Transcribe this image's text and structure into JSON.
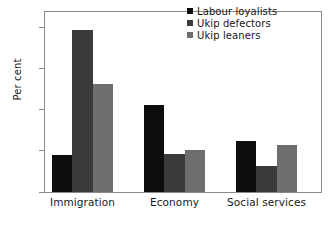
{
  "chart_data": {
    "type": "bar",
    "title": "",
    "subtitle": "",
    "xlabel": "",
    "ylabel": "Per cent",
    "categories": [
      "Immigration",
      "Economy",
      "Social services"
    ],
    "series": [
      {
        "name": "Labour loyalists",
        "color": "#0d0d0d",
        "values": [
          9.0,
          21.2,
          12.3
        ]
      },
      {
        "name": "Ukip defectors",
        "color": "#3a3a3a",
        "values": [
          39.3,
          9.2,
          6.3
        ]
      },
      {
        "name": "Ukip leaners",
        "color": "#6e6e6e",
        "values": [
          26.2,
          10.3,
          11.4
        ]
      }
    ],
    "ylim": [
      0,
      44
    ],
    "yticks": [
      0,
      10,
      20,
      30,
      40
    ],
    "ytick_labels": [
      "0",
      "10",
      "20",
      "30",
      "40"
    ],
    "grid": false,
    "legend_position": "top-right",
    "axis_color": "#8a8a8a",
    "background": "#ffffff"
  }
}
